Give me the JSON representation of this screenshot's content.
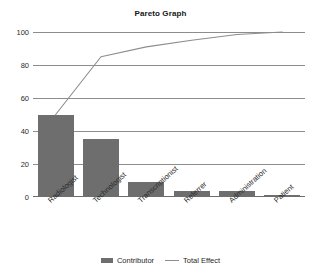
{
  "chart_data": {
    "type": "bar",
    "title": "Pareto Graph",
    "xlabel": "",
    "ylabel": "",
    "ylim": [
      0,
      100
    ],
    "yticks": [
      0,
      20,
      40,
      60,
      80,
      100
    ],
    "grid": true,
    "legend_position": "bottom",
    "categories": [
      "Radiologist",
      "Technologist",
      "Transcriptionist",
      "Referrer",
      "Administration",
      "Patient"
    ],
    "series": [
      {
        "name": "Contributor",
        "type": "bar",
        "color": "#6e6e6e",
        "values": [
          50,
          35,
          9,
          3.5,
          3.5,
          1
        ]
      },
      {
        "name": "Total Effect",
        "type": "line",
        "color": "#8d8d8d",
        "values": [
          50,
          85,
          91,
          95,
          98.5,
          100
        ]
      }
    ]
  },
  "legend": {
    "items": [
      {
        "label": "Contributor",
        "marker": "bar-swatch"
      },
      {
        "label": "Total Effect",
        "marker": "line-swatch"
      }
    ]
  }
}
